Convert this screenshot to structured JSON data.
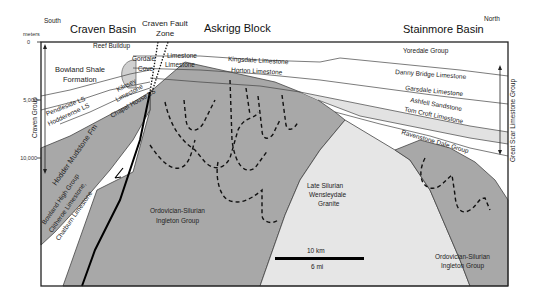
{
  "diagram": {
    "type": "geologic-cross-section",
    "orientation": {
      "left": "South",
      "right": "North"
    },
    "regions": {
      "craven_basin": "Craven Basin",
      "craven_fault_zone_line1": "Craven Fault",
      "craven_fault_zone_line2": "Zone",
      "askrigg_block": "Askrigg  Block",
      "stainmore_basin": "Stainmore Basin"
    },
    "depth_axis": {
      "unit": "meters",
      "ticks": [
        "0",
        "5,000",
        "10,000"
      ]
    },
    "groups": {
      "left": "Craven Group",
      "right": "Great Scar Limestone Group"
    },
    "units": {
      "reef_buildup": "Reef Buildup",
      "bowland_shale_line1": "Bowland Shale",
      "bowland_shale_line2": "Formation",
      "gordale": "Gordale",
      "cove": "Cove",
      "limestone_upper": "Limestone",
      "limestone_lower": "Limestone",
      "kilnsey_line1": "Kilnsey",
      "kilnsey_line2": "Limestone",
      "pendleside": "Pendleside LS",
      "hodderense": "Hodderense LS",
      "chapel_house": "Chapel House LS",
      "hodder_mudstone": "Hodder Mudstone Fm",
      "bowland_high_line1": "Bowland High Group",
      "bowland_high_line2": "Clitheroe Limestone,",
      "bowland_high_line3": "Chatburn Limestone",
      "kingsdale": "Kingsdale Limestone",
      "horton": "Horton Limestone",
      "yoredale": "Yoredale Group",
      "danny_bridge": "Danny Bridge Limestone",
      "garsdale": "Garsdale Limestone",
      "ashfell": "Ashfell Sandstone",
      "tom_croft": "Tom Croft Limestone",
      "ravenstone_dale": "Ravenstone Dale Group",
      "ingleton_left_line1": "Ordovician-Silurian",
      "ingleton_left_line2": "Ingleton Group",
      "granite_line1": "Late Silurian",
      "granite_line2": "Wensleydale",
      "granite_line3": "Granite",
      "ingleton_right_line1": "Ordovician-Silurian",
      "ingleton_right_line2": "Ingleton Group"
    },
    "scale_bar": {
      "top_label": "10 km",
      "bottom_label": "6 mi"
    },
    "colors": {
      "basement": "#a8a8a8",
      "granite": "#e6e6e6",
      "sediments": "#ffffff",
      "ashfell": "#e2e2e2",
      "reef": "#d0d0d0",
      "outline": "#222222"
    }
  }
}
